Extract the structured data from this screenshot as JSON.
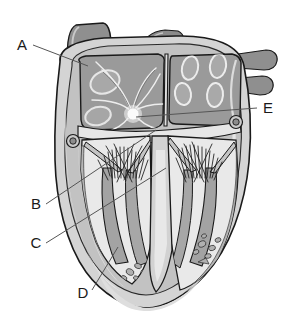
{
  "figure": {
    "kind": "anatomical-illustration",
    "style": "grayscale line drawing",
    "background_color": "#ffffff",
    "outline_color": "#1a1a1a",
    "width": 291,
    "height": 330
  },
  "labels": [
    {
      "id": "A",
      "text": "A",
      "x": 22,
      "y": 48,
      "leader_to_x": 88,
      "leader_to_y": 66
    },
    {
      "id": "B",
      "text": "B",
      "x": 34,
      "y": 208,
      "leader_to_x": 156,
      "leader_to_y": 130
    },
    {
      "id": "C",
      "text": "C",
      "x": 34,
      "y": 247,
      "leader_to_x": 166,
      "leader_to_y": 168
    },
    {
      "id": "D",
      "text": "D",
      "x": 80,
      "y": 297,
      "leader_to_x": 118,
      "leader_to_y": 247
    },
    {
      "id": "E",
      "text": "E",
      "x": 262,
      "y": 112,
      "leader_to_x": 136,
      "leader_to_y": 117
    }
  ],
  "palette": {
    "stroke": "#1a1a1a",
    "thin_stroke": "#4a4a4a",
    "epicardium": "#d6d6d6",
    "myocardium": "#b9b9b9",
    "myocardium_dark": "#9d9d9d",
    "chamber_wall_light": "#e4e4e4",
    "chamber_cavity": "#efefef",
    "atrium_fill": "#9a9a9a",
    "vessel_fill": "#8f8f8f",
    "vessel_fill_dark": "#858585",
    "papillary": "#a4a4a4",
    "highlight": "#f4f4f4",
    "node_glow": "#f7f7f7",
    "leader_line": "#555555",
    "label_text": "#1a1a1a"
  },
  "structures": {
    "great_vessels": [
      {
        "name": "superior-vena-cava",
        "side": "left-top"
      },
      {
        "name": "aorta-stump",
        "side": "center-top"
      },
      {
        "name": "pulmonary-vein-upper-right",
        "side": "right"
      },
      {
        "name": "pulmonary-vein-lower-right",
        "side": "right"
      }
    ],
    "chambers": [
      {
        "name": "right-atrium"
      },
      {
        "name": "left-atrium"
      },
      {
        "name": "right-ventricle"
      },
      {
        "name": "left-ventricle"
      }
    ],
    "features": [
      {
        "name": "conduction-node"
      },
      {
        "name": "conduction-fibers"
      },
      {
        "name": "interventricular-septum"
      },
      {
        "name": "chordae-tendineae"
      },
      {
        "name": "papillary-muscles"
      },
      {
        "name": "atrioventricular-valve-leaflets"
      },
      {
        "name": "coronary-vessel-cross-section-left"
      },
      {
        "name": "coronary-vessel-cross-section-right"
      },
      {
        "name": "cardiac-apex"
      },
      {
        "name": "pulmonary-vein-ostia"
      }
    ]
  }
}
